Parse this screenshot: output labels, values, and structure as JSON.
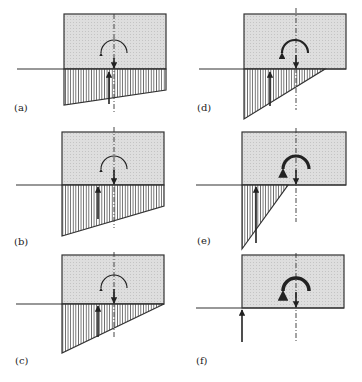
{
  "figure": {
    "panels": [
      {
        "id": "a",
        "label": "(a)",
        "pressure_shape": "trapezoid",
        "moment_weight": "thin",
        "resultant_offset": "slightly left of axis"
      },
      {
        "id": "b",
        "label": "(b)",
        "pressure_shape": "trapezoid",
        "moment_weight": "thin",
        "resultant_offset": "left of axis"
      },
      {
        "id": "c",
        "label": "(c)",
        "pressure_shape": "triangle, full width",
        "moment_weight": "thin",
        "resultant_offset": "left of axis"
      },
      {
        "id": "d",
        "label": "(d)",
        "pressure_shape": "triangle, partial width",
        "moment_weight": "medium",
        "resultant_offset": "further left of axis"
      },
      {
        "id": "e",
        "label": "(e)",
        "pressure_shape": "triangle, small",
        "moment_weight": "heavy",
        "resultant_offset": "near left edge"
      },
      {
        "id": "f",
        "label": "(f)",
        "pressure_shape": "none",
        "moment_weight": "heavy",
        "resultant_offset": "at left edge"
      }
    ]
  },
  "colors": {
    "block_fill": "#dcdcdc",
    "line": "#333333",
    "background": "#ffffff"
  }
}
